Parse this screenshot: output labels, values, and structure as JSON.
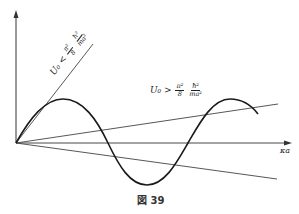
{
  "figure": {
    "caption": "図 39",
    "x_axis_label": "κa",
    "labels": {
      "steep_line": {
        "lhs": "U₀ <",
        "frac1_num": "π²",
        "frac1_den": "8",
        "frac2_num": "ħ²",
        "frac2_den": "ma²"
      },
      "shallow_line": {
        "lhs": "U₀ >",
        "frac1_num": "π²",
        "frac1_den": "8",
        "frac2_num": "ħ²",
        "frac2_den": "ma²"
      }
    },
    "colors": {
      "curve": "#1a1a1a",
      "lines": "#444444",
      "axes": "#333333"
    }
  }
}
